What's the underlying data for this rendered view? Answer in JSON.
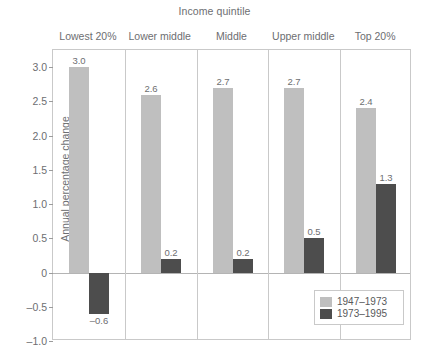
{
  "chart_data": {
    "type": "bar",
    "title": "Income quintile",
    "xlabel": "Income quintile",
    "ylabel": "Annual percentage change",
    "categories": [
      "Lowest 20%",
      "Lower middle",
      "Middle",
      "Upper middle",
      "Top 20%"
    ],
    "series": [
      {
        "name": "1947–1973",
        "color": "#bfbfbf",
        "values": [
          3.0,
          2.6,
          2.7,
          2.7,
          2.4
        ],
        "labels": [
          "3.0",
          "2.6",
          "2.7",
          "2.7",
          "2.4"
        ]
      },
      {
        "name": "1973–1995",
        "color": "#4d4d4d",
        "values": [
          -0.6,
          0.2,
          0.2,
          0.5,
          1.3
        ],
        "labels": [
          "–0.6",
          "0.2",
          "0.2",
          "0.5",
          "1.3"
        ]
      }
    ],
    "ylim": [
      -1.0,
      3.25
    ],
    "yticks": [
      3.0,
      2.5,
      2.0,
      1.5,
      1.0,
      0.5,
      0,
      -0.5,
      -1.0
    ],
    "ytick_labels": [
      "3.0",
      "2.5",
      "2.0",
      "1.5",
      "1.0",
      "0.5",
      "0",
      "–0.5",
      "–1.0"
    ],
    "grid": false,
    "legend_position": "bottom-right",
    "zero_line": true
  },
  "legend": {
    "entries": [
      {
        "label": "1947–1973",
        "color": "#bfbfbf"
      },
      {
        "label": "1973–1995",
        "color": "#4d4d4d"
      }
    ]
  }
}
